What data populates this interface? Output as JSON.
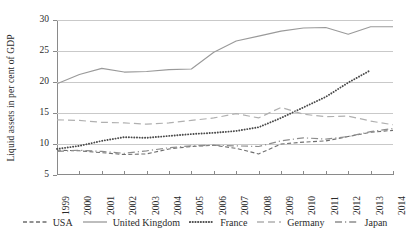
{
  "chart_data": {
    "type": "line",
    "title": "",
    "xlabel": "",
    "ylabel": "Liquid assets in per cent of GDP",
    "ylim": [
      5,
      30
    ],
    "yticks": [
      5,
      10,
      15,
      20,
      25,
      30
    ],
    "grid": true,
    "legend_position": "bottom",
    "x": [
      "1999",
      "2000",
      "2001",
      "2002",
      "2003",
      "2004",
      "2005",
      "2006",
      "2007",
      "2008",
      "2009",
      "2010",
      "2011",
      "2012",
      "2013",
      "2014"
    ],
    "series": [
      {
        "name": "USA",
        "style": "dashed",
        "color": "#6e6e6e",
        "values": [
          9.0,
          8.9,
          8.6,
          8.3,
          8.4,
          9.2,
          9.6,
          9.8,
          9.3,
          8.4,
          10.0,
          10.3,
          10.5,
          11.2,
          11.9,
          12.2
        ]
      },
      {
        "name": "United Kingdom",
        "style": "solid",
        "color": "#9a9a9a",
        "values": [
          19.7,
          21.2,
          22.2,
          21.6,
          21.7,
          22.0,
          22.1,
          24.8,
          26.6,
          27.4,
          28.2,
          28.7,
          28.8,
          27.7,
          28.9,
          28.9
        ]
      },
      {
        "name": "France",
        "style": "dotted",
        "color": "#4a4a4a",
        "values": [
          9.2,
          9.7,
          10.5,
          11.1,
          11.0,
          11.3,
          11.6,
          11.8,
          12.1,
          12.7,
          14.2,
          15.9,
          17.6,
          19.9,
          21.9,
          null
        ]
      },
      {
        "name": "Germany",
        "style": "longdash",
        "color": "#b0b0b0",
        "values": [
          13.9,
          13.8,
          13.5,
          13.4,
          13.2,
          13.4,
          13.8,
          14.2,
          14.9,
          14.2,
          15.9,
          14.8,
          14.4,
          14.5,
          13.7,
          13.1
        ]
      },
      {
        "name": "Japan",
        "style": "dashdot",
        "color": "#8d8d8d",
        "values": [
          8.8,
          9.0,
          8.8,
          8.5,
          8.9,
          9.4,
          9.7,
          9.8,
          9.7,
          9.6,
          10.5,
          11.0,
          10.8,
          11.2,
          12.0,
          12.5
        ]
      }
    ]
  },
  "legend": {
    "items": [
      {
        "label": "USA",
        "style": "dashed"
      },
      {
        "label": "United Kingdom",
        "style": "solid"
      },
      {
        "label": "France",
        "style": "dotted"
      },
      {
        "label": "Germany",
        "style": "longdash"
      },
      {
        "label": "Japan",
        "style": "dashdot"
      }
    ]
  }
}
